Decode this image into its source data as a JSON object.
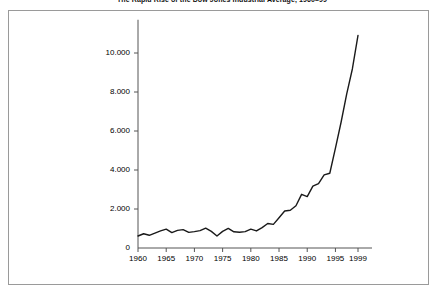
{
  "caption": "The Rapid Rise of the Dow Jones Industrial Average, 1960–99",
  "axis": {
    "y_ticks": [
      "0",
      "2.000",
      "4.000",
      "6.000",
      "8.000",
      "10.000"
    ],
    "x_ticks": [
      "1960",
      "1965",
      "1970",
      "1975",
      "1980",
      "1985",
      "1990",
      "1995",
      "1999"
    ]
  },
  "colors": {
    "line": "#1a1a1a",
    "axis": "#555555",
    "frame": "#9a9a9a",
    "background": "#ffffff",
    "text": "#000000"
  },
  "chart_data": {
    "type": "line",
    "title": "The Rapid Rise of the Dow Jones Industrial Average, 1960–99",
    "xlabel": "",
    "ylabel": "",
    "xlim": [
      1960,
      1999
    ],
    "ylim": [
      0,
      11500
    ],
    "grid": false,
    "legend": null,
    "y_tick_values": [
      0,
      2000,
      4000,
      6000,
      8000,
      10000
    ],
    "y_tick_labels": [
      "0",
      "2.000",
      "4.000",
      "6.000",
      "8.000",
      "10.000"
    ],
    "x_tick_values": [
      1960,
      1965,
      1970,
      1975,
      1980,
      1985,
      1990,
      1995,
      1999
    ],
    "x_tick_labels": [
      "1960",
      "1965",
      "1970",
      "1975",
      "1980",
      "1985",
      "1990",
      "1995",
      "1999"
    ],
    "series": [
      {
        "name": "Dow Jones Industrial Average",
        "x": [
          1960,
          1961,
          1962,
          1963,
          1964,
          1965,
          1966,
          1967,
          1968,
          1969,
          1970,
          1971,
          1972,
          1973,
          1974,
          1975,
          1976,
          1977,
          1978,
          1979,
          1980,
          1981,
          1982,
          1983,
          1984,
          1985,
          1986,
          1987,
          1988,
          1989,
          1990,
          1991,
          1992,
          1993,
          1994,
          1995,
          1996,
          1997,
          1998,
          1999
        ],
        "values": [
          616,
          731,
          652,
          763,
          874,
          969,
          786,
          905,
          944,
          800,
          839,
          890,
          1020,
          851,
          616,
          852,
          1005,
          831,
          805,
          839,
          964,
          875,
          1047,
          1259,
          1212,
          1547,
          1896,
          1939,
          2169,
          2753,
          2634,
          3169,
          3301,
          3754,
          3834,
          5117,
          6448,
          7908,
          9181,
          10900
        ]
      }
    ]
  }
}
